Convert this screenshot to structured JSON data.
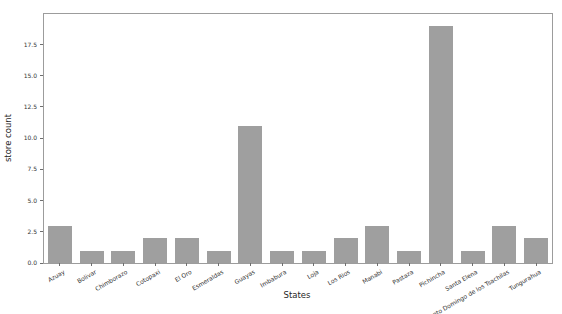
{
  "figure": {
    "background": "#ffffff",
    "width_px": 562,
    "height_px": 314
  },
  "chart_data": {
    "type": "bar",
    "xlabel": "States",
    "ylabel": "store count",
    "categories": [
      "Azuay",
      "Bolivar",
      "Chimborazo",
      "Cotopaxi",
      "El Oro",
      "Esmeraldas",
      "Guayas",
      "Imbabura",
      "Loja",
      "Los Rios",
      "Manabi",
      "Pastaza",
      "Pichincha",
      "Santa Elena",
      "Santo Domingo de los Tsachilas",
      "Tungurahua"
    ],
    "values": [
      3,
      1,
      1,
      2,
      2,
      1,
      11,
      1,
      1,
      2,
      3,
      1,
      19,
      1,
      3,
      2
    ],
    "ylim": [
      0,
      19.95
    ],
    "yticks": [
      0.0,
      2.5,
      5.0,
      7.5,
      10.0,
      12.5,
      15.0,
      17.5
    ],
    "ytick_decimals": 1,
    "grid": false,
    "legend": "none",
    "bar_color": "#9f9f9f",
    "spine_color": "#9c9c9c",
    "tick_color": "#6e6e6e",
    "text_color": "#333333",
    "xtick_rotation_deg": 30
  }
}
